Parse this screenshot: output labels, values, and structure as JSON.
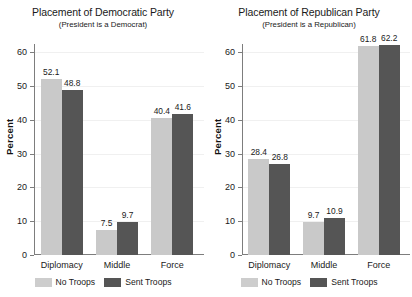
{
  "chart_data": [
    {
      "type": "bar",
      "title": "Placement of Democratic Party",
      "subtitle": "(President is a Democrat)",
      "xlabel": "",
      "ylabel": "Percent",
      "ylim": [
        0,
        60
      ],
      "yticks": [
        0,
        10,
        20,
        30,
        40,
        50,
        60
      ],
      "grid": true,
      "legend_position": "bottom",
      "categories": [
        "Diplomacy",
        "Middle",
        "Force"
      ],
      "series": [
        {
          "name": "No Troops",
          "color": "#c9c9c9",
          "values": [
            52.1,
            7.5,
            40.4
          ]
        },
        {
          "name": "Sent Troops",
          "color": "#555555",
          "values": [
            48.8,
            9.7,
            41.6
          ]
        }
      ]
    },
    {
      "type": "bar",
      "title": "Placement of Republican Party",
      "subtitle": "(President is a Republican)",
      "xlabel": "",
      "ylabel": "Percent",
      "ylim": [
        0,
        60
      ],
      "yticks": [
        0,
        10,
        20,
        30,
        40,
        50,
        60
      ],
      "grid": true,
      "legend_position": "bottom",
      "categories": [
        "Diplomacy",
        "Middle",
        "Force"
      ],
      "series": [
        {
          "name": "No Troops",
          "color": "#c9c9c9",
          "values": [
            28.4,
            9.7,
            61.8
          ]
        },
        {
          "name": "Sent Troops",
          "color": "#555555",
          "values": [
            26.8,
            10.9,
            62.2
          ]
        }
      ]
    }
  ]
}
